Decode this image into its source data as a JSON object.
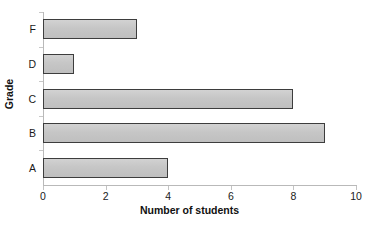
{
  "chart_data": {
    "type": "bar",
    "orientation": "horizontal",
    "title": "",
    "xlabel": "Number of students",
    "ylabel": "Grade",
    "categories": [
      "A",
      "B",
      "C",
      "D",
      "F"
    ],
    "values": [
      4,
      9,
      8,
      1,
      3
    ],
    "series": [
      {
        "name": "Number of students",
        "values": [
          4,
          9,
          8,
          1,
          3
        ]
      }
    ],
    "xlim": [
      0,
      10
    ],
    "xticks": [
      0,
      2,
      4,
      6,
      8,
      10
    ],
    "xtick_labels": [
      "0",
      "2",
      "4",
      "6",
      "8",
      "10"
    ],
    "ytick_labels_top_to_bottom": [
      "F",
      "D",
      "C",
      "B",
      "A"
    ],
    "grid": false,
    "legend": false,
    "legend_position": "none",
    "colors": {
      "bar_fill": "#c6c6c6",
      "bar_border": "#3d3d3d",
      "axis_line": "#b9b9b9",
      "tick_mark": "#c5c5c5",
      "text": "#1a1a1a",
      "background": "#ffffff"
    }
  }
}
